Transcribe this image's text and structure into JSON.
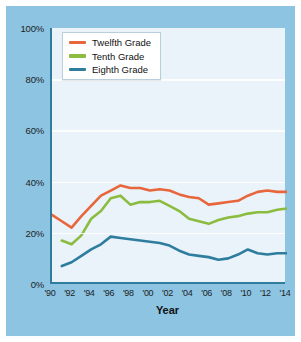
{
  "figure": {
    "background_color": "#8cc4e2",
    "plot_background_color": "#e9f3f9",
    "axis_color": "#2f7c9e",
    "gridline_color": "#ffffff"
  },
  "legend": {
    "position": "top-left-inside",
    "entries": [
      {
        "label": "Twelfth Grade",
        "color": "#e8663c"
      },
      {
        "label": "Tenth Grade",
        "color": "#8cbc3f"
      },
      {
        "label": "Eighth Grade",
        "color": "#2e7d9e"
      }
    ]
  },
  "chart_data": {
    "type": "line",
    "title": "",
    "subtitle": "",
    "xlabel": "Year",
    "ylabel": "",
    "xlim": [
      1990,
      2014
    ],
    "ylim": [
      0,
      100
    ],
    "ytick_labels": [
      "0%",
      "20%",
      "40%",
      "60%",
      "80%",
      "100%"
    ],
    "ytick_values": [
      0,
      20,
      40,
      60,
      80,
      100
    ],
    "xtick_labels": [
      "'90",
      "'92",
      "'94",
      "'96",
      "'98",
      "'00",
      "'02",
      "'04",
      "'06",
      "'08",
      "'10",
      "'12",
      "'14"
    ],
    "xtick_values": [
      1990,
      1992,
      1994,
      1996,
      1998,
      2000,
      2002,
      2004,
      2006,
      2008,
      2010,
      2012,
      2014
    ],
    "grid": true,
    "grid_axis": "y",
    "legend_position": "top-left-inside",
    "x": [
      1990,
      1991,
      1992,
      1993,
      1994,
      1995,
      1996,
      1997,
      1998,
      1999,
      2000,
      2001,
      2002,
      2003,
      2004,
      2005,
      2006,
      2007,
      2008,
      2009,
      2010,
      2011,
      2012,
      2013,
      2014
    ],
    "series": [
      {
        "name": "Twelfth Grade",
        "color": "#e8663c",
        "values": [
          27.0,
          24.5,
          22.0,
          26.5,
          30.5,
          34.5,
          36.5,
          38.5,
          37.5,
          37.5,
          36.5,
          37.0,
          36.5,
          35.0,
          34.0,
          33.5,
          31.0,
          31.5,
          32.0,
          32.5,
          34.5,
          36.0,
          36.5,
          36.0,
          36.0
        ]
      },
      {
        "name": "Tenth Grade",
        "color": "#8cbc3f",
        "values": [
          null,
          17.0,
          15.5,
          19.0,
          25.5,
          28.5,
          33.5,
          34.5,
          31.0,
          32.0,
          32.0,
          32.5,
          30.5,
          28.5,
          25.5,
          24.5,
          23.5,
          25.0,
          26.0,
          26.5,
          27.5,
          28.0,
          28.0,
          29.0,
          29.5
        ]
      },
      {
        "name": "Eighth Grade",
        "color": "#2e7d9e",
        "values": [
          null,
          7.0,
          8.5,
          11.0,
          13.5,
          15.5,
          18.5,
          18.0,
          17.5,
          17.0,
          16.5,
          16.0,
          15.0,
          13.0,
          11.5,
          11.0,
          10.5,
          9.5,
          10.0,
          11.5,
          13.5,
          12.0,
          11.5,
          12.0,
          12.0
        ]
      }
    ]
  }
}
